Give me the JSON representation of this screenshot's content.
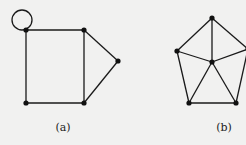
{
  "figure": {
    "background": "#f1f1f0",
    "edge_color": "#1a1a1a",
    "node_color": "#111111"
  },
  "graphs": [
    {
      "id": "a",
      "label": "(a)",
      "label_pos": [
        63,
        131
      ],
      "nodes": [
        {
          "id": "a1",
          "x": 26,
          "y": 30
        },
        {
          "id": "a2",
          "x": 84,
          "y": 30
        },
        {
          "id": "a3",
          "x": 118,
          "y": 61
        },
        {
          "id": "a4",
          "x": 84,
          "y": 103
        },
        {
          "id": "a5",
          "x": 26,
          "y": 103
        }
      ],
      "edges": [
        [
          "a1",
          "a2"
        ],
        [
          "a2",
          "a4"
        ],
        [
          "a4",
          "a5"
        ],
        [
          "a5",
          "a1"
        ],
        [
          "a2",
          "a3"
        ],
        [
          "a3",
          "a4"
        ]
      ],
      "loops": [
        {
          "node": "a1",
          "cx": 22,
          "cy": 20,
          "r": 10
        }
      ]
    },
    {
      "id": "b",
      "label": "(b)",
      "label_pos": [
        224,
        131
      ],
      "nodes": [
        {
          "id": "b1",
          "x": 212,
          "y": 18
        },
        {
          "id": "b2",
          "x": 177,
          "y": 51
        },
        {
          "id": "b3",
          "x": 212,
          "y": 62
        },
        {
          "id": "b4",
          "x": 189,
          "y": 103
        },
        {
          "id": "b5",
          "x": 236,
          "y": 103
        },
        {
          "id": "b6",
          "x": 248,
          "y": 49
        }
      ],
      "edges": [
        [
          "b1",
          "b2"
        ],
        [
          "b1",
          "b3"
        ],
        [
          "b1",
          "b6"
        ],
        [
          "b2",
          "b3"
        ],
        [
          "b2",
          "b4"
        ],
        [
          "b3",
          "b4"
        ],
        [
          "b3",
          "b5"
        ],
        [
          "b3",
          "b6"
        ],
        [
          "b4",
          "b5"
        ],
        [
          "b5",
          "b6"
        ]
      ],
      "loops": []
    }
  ]
}
